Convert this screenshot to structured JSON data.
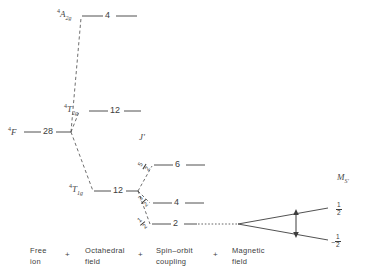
{
  "figure": {
    "type": "energy-level-diagram",
    "title": ""
  },
  "headers": {
    "j_quantum_number": "J'",
    "ms_quantum_number": "M",
    "ms_subscript": "S'"
  },
  "free_ion": {
    "term_superscript": "4",
    "term_letter": "F",
    "degeneracy": "28"
  },
  "octahedral_field": {
    "levels": [
      {
        "name": "A2g",
        "term_superscript": "4",
        "term_letter": "T",
        "letter": "A",
        "sub": "2g",
        "degeneracy": "4"
      },
      {
        "name": "T2g",
        "term_superscript": "4",
        "letter": "T",
        "sub": "2g",
        "degeneracy": "12"
      },
      {
        "name": "T1g",
        "term_superscript": "4",
        "letter": "T",
        "sub": "1g",
        "degeneracy": "12"
      }
    ]
  },
  "spin_orbit": {
    "levels": [
      {
        "j_num": "5",
        "j_den": "2",
        "degeneracy": "6"
      },
      {
        "j_num": "3",
        "j_den": "2",
        "degeneracy": "4"
      },
      {
        "j_num": "1",
        "j_den": "2",
        "degeneracy": "2"
      }
    ]
  },
  "magnetic_field": {
    "zeeman_levels": [
      {
        "sign": "",
        "num": "1",
        "den": "2",
        "position": "upper"
      },
      {
        "sign": "−",
        "num": "1",
        "den": "2",
        "position": "lower"
      }
    ],
    "splitting_arrow": "double-headed-vertical-arrow"
  },
  "footer": {
    "columns": [
      {
        "line1": "Free",
        "line2": "ion"
      },
      {
        "line1": "Octahedral",
        "line2": "field"
      },
      {
        "line1": "Spin–orbit",
        "line2": "coupling"
      },
      {
        "line1": "Magnetic",
        "line2": "field"
      }
    ],
    "separator": "+"
  },
  "colors": {
    "line": "#3d3d3d",
    "text": "#3d3d3d",
    "background": "#ffffff"
  }
}
